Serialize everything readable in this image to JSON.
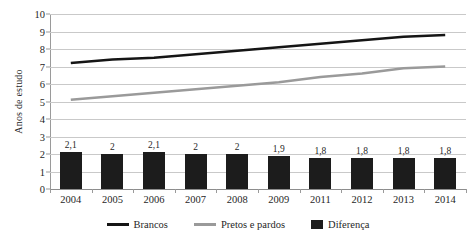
{
  "chart_data": {
    "type": "line",
    "title": "",
    "xlabel": "",
    "ylabel": "Anos de estudo",
    "ylim": [
      0,
      10
    ],
    "ytick_step": 1,
    "grid": true,
    "legend_position": "bottom",
    "categories": [
      "2004",
      "2005",
      "2006",
      "2007",
      "2008",
      "2009",
      "2011",
      "2012",
      "2013",
      "2014"
    ],
    "yticks": [
      "10",
      "9",
      "8",
      "7",
      "6",
      "5",
      "4",
      "3",
      "2",
      "1",
      "0"
    ],
    "series": [
      {
        "name": "Brancos",
        "kind": "line",
        "color": "#151515",
        "values": [
          7.2,
          7.4,
          7.5,
          7.7,
          7.9,
          8.1,
          8.3,
          8.5,
          8.7,
          8.8
        ]
      },
      {
        "name": "Pretos e pardos",
        "kind": "line",
        "color": "#9a9a9a",
        "values": [
          5.1,
          5.3,
          5.5,
          5.7,
          5.9,
          6.1,
          6.4,
          6.6,
          6.9,
          7.0
        ]
      },
      {
        "name": "Diferença",
        "kind": "bar",
        "color": "#1c1c1c",
        "values": [
          2.1,
          2.0,
          2.1,
          2.0,
          2.0,
          1.9,
          1.8,
          1.8,
          1.8,
          1.8
        ],
        "labels": [
          "2,1",
          "2",
          "2,1",
          "2",
          "2",
          "1,9",
          "1,8",
          "1,8",
          "1,8",
          "1,8"
        ]
      }
    ]
  },
  "legend": {
    "items": [
      {
        "label": "Brancos",
        "marker": "line-swatch-black",
        "color": "#151515"
      },
      {
        "label": "Pretos e pardos",
        "marker": "line-swatch-gray",
        "color": "#9a9a9a"
      },
      {
        "label": "Diferença",
        "marker": "box-swatch-black",
        "color": "#1c1c1c"
      }
    ]
  }
}
